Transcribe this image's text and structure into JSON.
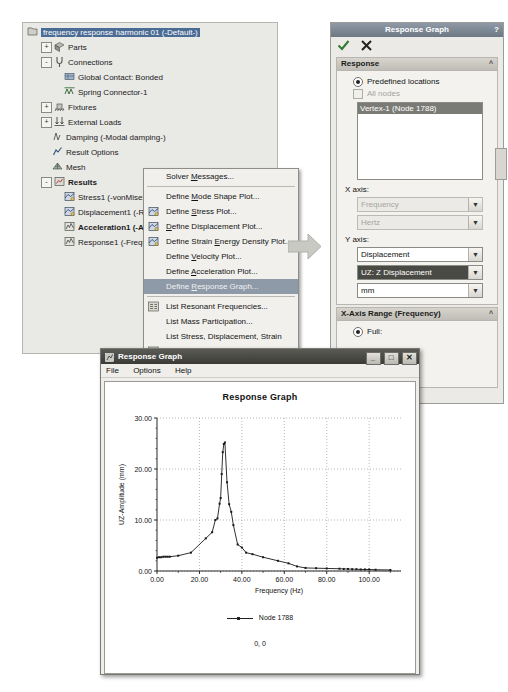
{
  "tree": {
    "root": "frequency response harmonic 01 (-Default-)",
    "items": [
      {
        "label": "Parts",
        "indent": 1,
        "expander": "+",
        "icon": "parts-icon"
      },
      {
        "label": "Connections",
        "indent": 1,
        "expander": "-",
        "icon": "connections-icon"
      },
      {
        "label": "Global Contact: Bonded",
        "indent": 2,
        "expander": "",
        "icon": "contact-icon"
      },
      {
        "label": "Spring Connector-1",
        "indent": 2,
        "expander": "",
        "icon": "spring-icon"
      },
      {
        "label": "Fixtures",
        "indent": 1,
        "expander": "+",
        "icon": "fixtures-icon"
      },
      {
        "label": "External Loads",
        "indent": 1,
        "expander": "+",
        "icon": "loads-icon"
      },
      {
        "label": "Damping (-Modal damping-)",
        "indent": 1,
        "expander": "",
        "icon": "damping-icon"
      },
      {
        "label": "Result Options",
        "indent": 1,
        "expander": "",
        "icon": "result-options-icon"
      },
      {
        "label": "Mesh",
        "indent": 1,
        "expander": "",
        "icon": "mesh-icon"
      },
      {
        "label": "Results",
        "indent": 1,
        "expander": "-",
        "icon": "results-icon",
        "bold": true
      },
      {
        "label": "Stress1 (-vonMises-)",
        "indent": 2,
        "expander": "",
        "icon": "stress-plot-icon"
      },
      {
        "label": "Displacement1 (-Res disp",
        "indent": 2,
        "expander": "",
        "icon": "displacement-plot-icon"
      },
      {
        "label": "Acceleration1 (-ARES",
        "indent": 2,
        "expander": "",
        "icon": "acceleration-plot-icon",
        "bold": true
      },
      {
        "label": "Response1 (-Frequency-",
        "indent": 2,
        "expander": "",
        "icon": "response-plot-icon"
      }
    ]
  },
  "context_menu": {
    "items": [
      {
        "label": "Solver Messages...",
        "icon": "",
        "underline": "M",
        "highlight": false
      },
      {
        "sep": true
      },
      {
        "label": "Define Mode Shape Plot...",
        "icon": "",
        "underline": "M",
        "highlight": false
      },
      {
        "label": "Define Stress Plot...",
        "icon": "stress-plot-icon",
        "underline": "S",
        "highlight": false
      },
      {
        "label": "Define Displacement Plot...",
        "icon": "displacement-plot-icon",
        "underline": "D",
        "highlight": false
      },
      {
        "label": "Define Strain Energy Density Plot...",
        "icon": "strain-plot-icon",
        "underline": "E",
        "highlight": false
      },
      {
        "label": "Define Velocity Plot...",
        "icon": "",
        "underline": "V",
        "highlight": false
      },
      {
        "label": "Define Acceleration Plot...",
        "icon": "",
        "underline": "A",
        "highlight": false
      },
      {
        "label": "Define Response Graph...",
        "icon": "",
        "underline": "R",
        "highlight": true
      },
      {
        "sep": true
      },
      {
        "label": "List Resonant Frequencies...",
        "icon": "list-freq-icon",
        "highlight": false
      },
      {
        "label": "List Mass Participation...",
        "icon": "",
        "highlight": false
      },
      {
        "label": "List Stress, Displacement, Strain",
        "icon": "",
        "highlight": false
      },
      {
        "label": "List Result Force...",
        "icon": "list-force-icon",
        "highlight": false
      },
      {
        "sep": true
      },
      {
        "label": "Save All Plots as JPEG Files",
        "icon": "",
        "underline": "J",
        "highlight": false
      },
      {
        "label": "Save All Plots as eDrawings",
        "icon": "",
        "underline": "e",
        "highlight": false
      }
    ]
  },
  "property_manager": {
    "title": "Response Graph",
    "help_label": "?",
    "ok_label": "ok-check",
    "cancel_label": "cancel-x",
    "response_section": {
      "header": "Response",
      "predefined_label": "Predefined locations",
      "all_nodes_label": "All nodes",
      "selected_entity": "Vertex-1 (Node 1788)"
    },
    "x_axis": {
      "label": "X axis:",
      "quantity": "Frequency",
      "unit": "Hertz"
    },
    "y_axis": {
      "label": "Y axis:",
      "quantity": "Displacement",
      "component": "UZ: Z Displacement",
      "unit": "mm"
    },
    "x_range_section": {
      "header": "X-Axis Range  (Frequency)",
      "full_label": "Full:"
    }
  },
  "graph_window": {
    "title": "Response Graph",
    "menu": [
      "File",
      "Options",
      "Help"
    ],
    "window_buttons": {
      "minimize": "_",
      "maximize": "□",
      "close": "✕"
    },
    "status": "0, 0"
  },
  "chart_data": {
    "type": "line",
    "title": "Response Graph",
    "xlabel": "Frequency (Hz)",
    "ylabel": "UZ-Amplitude (mm)",
    "legend": [
      "Node 1788"
    ],
    "legend_position": "bottom",
    "grid": true,
    "xlim": [
      0,
      115
    ],
    "ylim": [
      0,
      30
    ],
    "xticks": [
      0,
      20,
      40,
      60,
      80,
      100
    ],
    "xtick_labels": [
      "0.00",
      "20.00",
      "40.00",
      "60.00",
      "80.00",
      "100.00"
    ],
    "yticks": [
      0,
      10,
      20,
      30
    ],
    "ytick_labels": [
      "0.00",
      "10.00",
      "20.00",
      "30.00"
    ],
    "series": [
      {
        "name": "Node 1788",
        "x": [
          0,
          1,
          2,
          3,
          4,
          5,
          6,
          10,
          16,
          23,
          26,
          27.5,
          28.5,
          29.5,
          30,
          30.5,
          31,
          31.5,
          32,
          33,
          34,
          35,
          36,
          38,
          40,
          42,
          45,
          50,
          57,
          62,
          66,
          70,
          75,
          80,
          86,
          88,
          90,
          92,
          94,
          96,
          98,
          100,
          103,
          110
        ],
        "y": [
          2.6,
          2.7,
          2.7,
          2.8,
          2.8,
          2.8,
          2.8,
          3.0,
          3.6,
          6.4,
          7.6,
          10.0,
          10.3,
          13.2,
          14.3,
          19.0,
          23.3,
          24.9,
          25.2,
          17.4,
          13.1,
          11.6,
          9.0,
          5.2,
          4.6,
          3.6,
          3.3,
          2.7,
          2.0,
          1.5,
          0.9,
          0.6,
          0.55,
          0.5,
          0.45,
          0.4,
          0.4,
          0.35,
          0.35,
          0.3,
          0.3,
          0.3,
          0.25,
          0.2
        ]
      }
    ]
  }
}
